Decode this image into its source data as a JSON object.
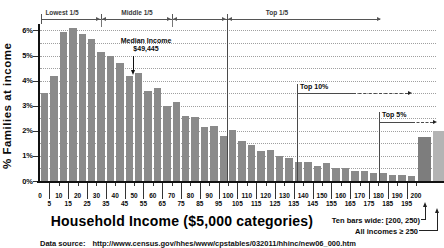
{
  "figure": {
    "y_axis_title": "% Families at income",
    "x_axis_title": "Household Income ($5,000 categories)",
    "source_label": "Data source:",
    "source_url": "http://www.census.gov/hhes/www/cpstables/032011/hhinc/new06_000.htm",
    "annotations": {
      "lowest_fifth": "Lowest 1/5",
      "middle_fifth": "Middle 1/5",
      "top_fifth": "Top 1/5",
      "median_line1": "Median Income",
      "median_line2": "$49,445",
      "top10": "Top 10%",
      "top5": "Top 5%",
      "ten_bars_note": "Ten bars wide: [200, 250)",
      "all_incomes_note": "All incomes ≥ 250"
    }
  },
  "chart_data": {
    "type": "bar",
    "title": "",
    "xlabel": "Household Income ($5,000 categories)",
    "ylabel": "% Families at income",
    "ylim": [
      0,
      6.25
    ],
    "grid": "dotted horizontal lines every 0.5%",
    "legend": "none",
    "bar_color": "#8a8a8a",
    "y_tick_labels": [
      "0%",
      "1%",
      "2%",
      "3%",
      "4%",
      "5%",
      "6%"
    ],
    "x_tick_labels_row1": [
      "0",
      "10",
      "20",
      "30",
      "40",
      "50",
      "60",
      "70",
      "80",
      "90",
      "100",
      "110",
      "120",
      "130",
      "140",
      "150",
      "160",
      "170",
      "180",
      "190",
      "200"
    ],
    "x_tick_labels_row2": [
      "5",
      "15",
      "25",
      "35",
      "45",
      "55",
      "65",
      "75",
      "85",
      "95",
      "105",
      "115",
      "125",
      "135",
      "145",
      "155",
      "165",
      "175",
      "185",
      "195"
    ],
    "bin_width_thousands": 5,
    "bin_start_thousands": [
      0,
      5,
      10,
      15,
      20,
      25,
      30,
      35,
      40,
      45,
      50,
      55,
      60,
      65,
      70,
      75,
      80,
      85,
      90,
      95,
      100,
      105,
      110,
      115,
      120,
      125,
      130,
      135,
      140,
      145,
      150,
      155,
      160,
      165,
      170,
      175,
      180,
      185,
      190,
      195
    ],
    "values_percent": [
      3.5,
      4.2,
      5.95,
      6.1,
      5.85,
      5.65,
      5.15,
      5.0,
      4.7,
      4.2,
      4.3,
      3.6,
      3.7,
      3.0,
      3.15,
      2.6,
      2.55,
      2.15,
      2.2,
      1.8,
      2.05,
      1.6,
      1.45,
      1.2,
      1.25,
      1.0,
      0.9,
      0.75,
      0.75,
      0.6,
      0.7,
      0.5,
      0.5,
      0.4,
      0.4,
      0.3,
      0.3,
      0.25,
      0.25,
      0.2
    ],
    "extra_bars": [
      {
        "range": "[200,250)",
        "value_percent": 1.75,
        "color": "#7d7d7d"
      },
      {
        "range": "≥ 250",
        "value_percent": 2.0,
        "color": "#b4b4b4"
      }
    ],
    "annotations_data": {
      "median_income_dollars": 49445,
      "quintile_bracket_labels": [
        "Lowest 1/5",
        "Middle 1/5",
        "Top 1/5"
      ],
      "top_10_percent_label": "Top 10%",
      "top_5_percent_label": "Top 5%"
    }
  }
}
